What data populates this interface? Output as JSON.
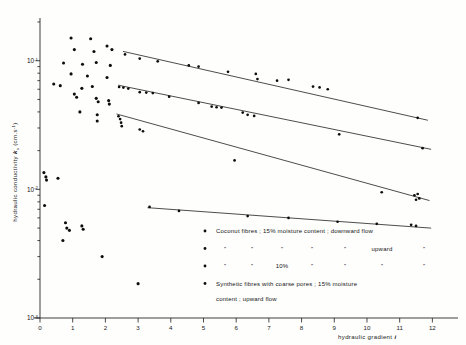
{
  "figure": {
    "background_color": "#fefefd",
    "ink_color": "#121212"
  },
  "axes": {
    "y": {
      "label_main": "hydraulic conductivity",
      "label_symbol": "k",
      "label_symbol_sub": "s",
      "label_units": "(cm.s",
      "label_units_exp": "-1",
      "label_units_close": ")",
      "scale": "log",
      "decade_labels": [
        "10",
        "10",
        "10"
      ],
      "decade_exponents": [
        "-1",
        "-2",
        "-3"
      ],
      "min": 0.001,
      "max": 0.2
    },
    "x": {
      "label": "hydraulic gradient",
      "label_symbol": "i",
      "scale": "linear",
      "min": 0,
      "max": 12.6,
      "tick_labels": [
        "0",
        "1",
        "2",
        "3",
        "4",
        "5",
        "6",
        "7",
        "8",
        "9",
        "10",
        "11",
        "12"
      ]
    }
  },
  "legend": {
    "rows": [
      {
        "marker": "dot",
        "type": "full",
        "text": "Coconut fibres ; 15% moisture content ; downward flow"
      },
      {
        "marker": "dot",
        "type": "ditto",
        "cells": [
          "”",
          "”",
          "”",
          "”",
          "”",
          "upward",
          "”"
        ]
      },
      {
        "marker": "dot",
        "type": "ditto",
        "cells": [
          "”",
          "”",
          "10%",
          "”",
          "”",
          "”",
          "”"
        ]
      },
      {
        "marker": "dot",
        "type": "full",
        "text": "Synthetic fibres with coarse pores ; 15% moisture",
        "text_line2": "content ; upward flow"
      }
    ]
  },
  "chart_data": {
    "type": "scatter",
    "title": "",
    "xlabel": "hydraulic gradient i",
    "ylabel": "hydraulic conductivity ks (cm.s-1)",
    "xlim": [
      0,
      12.6
    ],
    "ylim": [
      0.001,
      0.2
    ],
    "yscale": "log",
    "grid": false,
    "legend_position": "inside-bottom-right",
    "series": [
      {
        "name": "Coconut fibres ; 15% moisture content ; downward flow",
        "marker": "dot",
        "trendline": {
          "x": [
            2.55,
            11.85
          ],
          "y": [
            0.118,
            0.0345
          ]
        },
        "points": [
          {
            "x": 2.6,
            "y": 0.112
          },
          {
            "x": 3.05,
            "y": 0.104
          },
          {
            "x": 3.6,
            "y": 0.099
          },
          {
            "x": 4.55,
            "y": 0.092
          },
          {
            "x": 4.85,
            "y": 0.09
          },
          {
            "x": 5.75,
            "y": 0.082
          },
          {
            "x": 6.6,
            "y": 0.079
          },
          {
            "x": 6.65,
            "y": 0.072
          },
          {
            "x": 7.25,
            "y": 0.07
          },
          {
            "x": 7.6,
            "y": 0.071
          },
          {
            "x": 8.35,
            "y": 0.063
          },
          {
            "x": 8.55,
            "y": 0.062
          },
          {
            "x": 8.8,
            "y": 0.06
          },
          {
            "x": 11.55,
            "y": 0.036
          }
        ]
      },
      {
        "name": "Coconut fibres ; 15% moisture content ; upward flow",
        "marker": "dot",
        "trendline": {
          "x": [
            2.4,
            11.95
          ],
          "y": [
            0.0645,
            0.0205
          ]
        },
        "points": [
          {
            "x": 2.42,
            "y": 0.0625
          },
          {
            "x": 2.55,
            "y": 0.0618
          },
          {
            "x": 2.7,
            "y": 0.0607
          },
          {
            "x": 3.05,
            "y": 0.057
          },
          {
            "x": 3.25,
            "y": 0.0565
          },
          {
            "x": 3.45,
            "y": 0.056
          },
          {
            "x": 3.95,
            "y": 0.0525
          },
          {
            "x": 4.85,
            "y": 0.047
          },
          {
            "x": 5.25,
            "y": 0.044
          },
          {
            "x": 5.4,
            "y": 0.0435
          },
          {
            "x": 5.55,
            "y": 0.0432
          },
          {
            "x": 6.2,
            "y": 0.0395
          },
          {
            "x": 6.35,
            "y": 0.038
          },
          {
            "x": 6.55,
            "y": 0.0372
          },
          {
            "x": 9.15,
            "y": 0.0268
          },
          {
            "x": 11.7,
            "y": 0.0209
          }
        ]
      },
      {
        "name": "Coconut fibres ; 10% moisture content ; upward flow",
        "marker": "dot",
        "trendline": {
          "x": [
            2.35,
            11.9
          ],
          "y": [
            0.0385,
            0.0082
          ]
        },
        "points": [
          {
            "x": 2.4,
            "y": 0.037
          },
          {
            "x": 2.45,
            "y": 0.0352
          },
          {
            "x": 2.48,
            "y": 0.033
          },
          {
            "x": 2.5,
            "y": 0.031
          },
          {
            "x": 3.05,
            "y": 0.0292
          },
          {
            "x": 3.15,
            "y": 0.0283
          },
          {
            "x": 5.95,
            "y": 0.0168
          },
          {
            "x": 10.45,
            "y": 0.0095
          },
          {
            "x": 11.45,
            "y": 0.009
          },
          {
            "x": 11.55,
            "y": 0.0092
          },
          {
            "x": 11.5,
            "y": 0.0083
          },
          {
            "x": 11.6,
            "y": 0.0085
          }
        ]
      },
      {
        "name": "Synthetic fibres with coarse pores ; 15% moisture content ; upward flow",
        "marker": "dot",
        "trendline": {
          "x": [
            3.3,
            11.95
          ],
          "y": [
            0.0072,
            0.005
          ]
        },
        "points": [
          {
            "x": 3.35,
            "y": 0.0073
          },
          {
            "x": 4.25,
            "y": 0.0068
          },
          {
            "x": 6.35,
            "y": 0.0062
          },
          {
            "x": 7.6,
            "y": 0.006
          },
          {
            "x": 9.1,
            "y": 0.0056
          },
          {
            "x": 10.3,
            "y": 0.0054
          },
          {
            "x": 11.35,
            "y": 0.0053
          },
          {
            "x": 11.5,
            "y": 0.0052
          }
        ]
      },
      {
        "name": "low-gradient scatter cloud",
        "marker": "dot",
        "trendline": null,
        "points": [
          {
            "x": 0.95,
            "y": 0.15
          },
          {
            "x": 1.55,
            "y": 0.148
          },
          {
            "x": 1.05,
            "y": 0.122
          },
          {
            "x": 1.65,
            "y": 0.118
          },
          {
            "x": 2.05,
            "y": 0.13
          },
          {
            "x": 2.2,
            "y": 0.122
          },
          {
            "x": 0.72,
            "y": 0.096
          },
          {
            "x": 1.3,
            "y": 0.094
          },
          {
            "x": 1.72,
            "y": 0.097
          },
          {
            "x": 2.15,
            "y": 0.092
          },
          {
            "x": 0.95,
            "y": 0.079
          },
          {
            "x": 1.45,
            "y": 0.076
          },
          {
            "x": 2.05,
            "y": 0.074
          },
          {
            "x": 0.42,
            "y": 0.066
          },
          {
            "x": 0.62,
            "y": 0.064
          },
          {
            "x": 1.28,
            "y": 0.061
          },
          {
            "x": 1.6,
            "y": 0.063
          },
          {
            "x": 1.05,
            "y": 0.055
          },
          {
            "x": 1.12,
            "y": 0.052
          },
          {
            "x": 1.72,
            "y": 0.051
          },
          {
            "x": 1.78,
            "y": 0.048
          },
          {
            "x": 2.1,
            "y": 0.049
          },
          {
            "x": 2.12,
            "y": 0.046
          },
          {
            "x": 1.22,
            "y": 0.04
          },
          {
            "x": 1.75,
            "y": 0.038
          },
          {
            "x": 1.75,
            "y": 0.034
          },
          {
            "x": 0.12,
            "y": 0.0135
          },
          {
            "x": 0.18,
            "y": 0.0125
          },
          {
            "x": 0.2,
            "y": 0.0118
          },
          {
            "x": 0.55,
            "y": 0.0122
          },
          {
            "x": 0.14,
            "y": 0.0075
          },
          {
            "x": 0.78,
            "y": 0.0055
          },
          {
            "x": 0.82,
            "y": 0.005
          },
          {
            "x": 0.9,
            "y": 0.0048
          },
          {
            "x": 1.28,
            "y": 0.0052
          },
          {
            "x": 1.32,
            "y": 0.0049
          },
          {
            "x": 0.7,
            "y": 0.004
          },
          {
            "x": 1.9,
            "y": 0.003
          },
          {
            "x": 3.0,
            "y": 0.00185
          }
        ]
      }
    ]
  }
}
